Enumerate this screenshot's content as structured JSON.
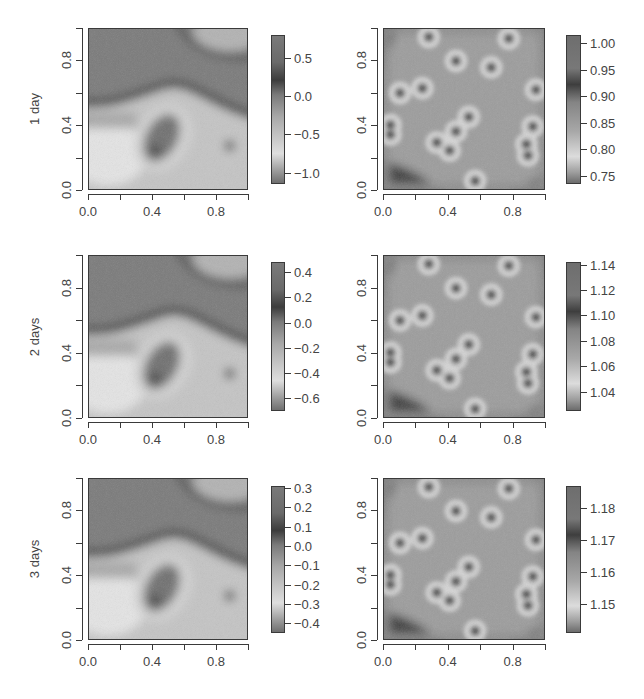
{
  "figure": {
    "rows": [
      {
        "label": "1 day"
      },
      {
        "label": "2 days"
      },
      {
        "label": "3 days"
      }
    ],
    "axis_ticks": [
      "0.0",
      "0.4",
      "0.8"
    ]
  },
  "chart_data": [
    {
      "type": "heatmap",
      "row": "1 day",
      "column": "left",
      "title": "",
      "ylabel": "1 day",
      "xlabel": "",
      "x_ticks": [
        "0.0",
        "0.4",
        "0.8"
      ],
      "y_ticks": [
        "0.0",
        "0.4",
        "0.8"
      ],
      "xlim": [
        0,
        1
      ],
      "ylim": [
        0,
        1
      ],
      "colorbar": {
        "ticks": [
          "0.5",
          "0.0",
          "−0.5",
          "−1.0"
        ],
        "values": [
          0.5,
          0.0,
          -0.5,
          -1.0
        ],
        "range": [
          -1.15,
          0.8
        ]
      },
      "features": "smooth field: dark band from (0,0.55) rising to (0.5,0.65) then down to (1,0.45); light region lower-left; dark elliptical spot near (0.4,0.25) with light ring; small dark spot near (0.88,0.27); light blob upper right near (0.85,0.95)"
    },
    {
      "type": "heatmap",
      "row": "1 day",
      "column": "right",
      "x_ticks": [
        "0.0",
        "0.4",
        "0.8"
      ],
      "y_ticks": [
        "0.0",
        "0.4",
        "0.8"
      ],
      "xlim": [
        0,
        1
      ],
      "ylim": [
        0,
        1
      ],
      "colorbar": {
        "ticks": [
          "1.00",
          "0.95",
          "0.90",
          "0.85",
          "0.80",
          "0.75"
        ],
        "values": [
          1.0,
          0.95,
          0.9,
          0.85,
          0.8,
          0.75
        ],
        "range": [
          0.735,
          1.015
        ]
      },
      "points": [
        [
          0.28,
          0.95
        ],
        [
          0.78,
          0.94
        ],
        [
          0.45,
          0.8
        ],
        [
          0.67,
          0.76
        ],
        [
          0.1,
          0.6
        ],
        [
          0.24,
          0.63
        ],
        [
          0.95,
          0.62
        ],
        [
          0.04,
          0.4
        ],
        [
          0.04,
          0.34
        ],
        [
          0.53,
          0.45
        ],
        [
          0.45,
          0.36
        ],
        [
          0.33,
          0.29
        ],
        [
          0.41,
          0.24
        ],
        [
          0.93,
          0.39
        ],
        [
          0.89,
          0.28
        ],
        [
          0.9,
          0.21
        ],
        [
          0.57,
          0.05
        ]
      ]
    },
    {
      "type": "heatmap",
      "row": "2 days",
      "column": "left",
      "ylabel": "2 days",
      "x_ticks": [
        "0.0",
        "0.4",
        "0.8"
      ],
      "y_ticks": [
        "0.0",
        "0.4",
        "0.8"
      ],
      "xlim": [
        0,
        1
      ],
      "ylim": [
        0,
        1
      ],
      "colorbar": {
        "ticks": [
          "0.4",
          "0.2",
          "0.0",
          "−0.2",
          "−0.4",
          "−0.6"
        ],
        "values": [
          0.4,
          0.2,
          0.0,
          -0.2,
          -0.4,
          -0.6
        ],
        "range": [
          -0.7,
          0.48
        ]
      }
    },
    {
      "type": "heatmap",
      "row": "2 days",
      "column": "right",
      "x_ticks": [
        "0.0",
        "0.4",
        "0.8"
      ],
      "y_ticks": [
        "0.0",
        "0.4",
        "0.8"
      ],
      "xlim": [
        0,
        1
      ],
      "ylim": [
        0,
        1
      ],
      "colorbar": {
        "ticks": [
          "1.14",
          "1.12",
          "1.10",
          "1.08",
          "1.06",
          "1.04"
        ],
        "values": [
          1.14,
          1.12,
          1.1,
          1.08,
          1.06,
          1.04
        ],
        "range": [
          1.025,
          1.142
        ]
      }
    },
    {
      "type": "heatmap",
      "row": "3 days",
      "column": "left",
      "ylabel": "3 days",
      "x_ticks": [
        "0.0",
        "0.4",
        "0.8"
      ],
      "y_ticks": [
        "0.0",
        "0.4",
        "0.8"
      ],
      "xlim": [
        0,
        1
      ],
      "ylim": [
        0,
        1
      ],
      "colorbar": {
        "ticks": [
          "0.3",
          "0.2",
          "0.1",
          "0.0",
          "−0.1",
          "−0.2",
          "−0.3",
          "−0.4"
        ],
        "values": [
          0.3,
          0.2,
          0.1,
          0.0,
          -0.1,
          -0.2,
          -0.3,
          -0.4
        ],
        "range": [
          -0.45,
          0.31
        ]
      }
    },
    {
      "type": "heatmap",
      "row": "3 days",
      "column": "right",
      "x_ticks": [
        "0.0",
        "0.4",
        "0.8"
      ],
      "y_ticks": [
        "0.0",
        "0.4",
        "0.8"
      ],
      "xlim": [
        0,
        1
      ],
      "ylim": [
        0,
        1
      ],
      "colorbar": {
        "ticks": [
          "1.18",
          "1.17",
          "1.16",
          "1.15"
        ],
        "values": [
          1.18,
          1.17,
          1.16,
          1.15
        ],
        "range": [
          1.141,
          1.187
        ]
      }
    }
  ]
}
